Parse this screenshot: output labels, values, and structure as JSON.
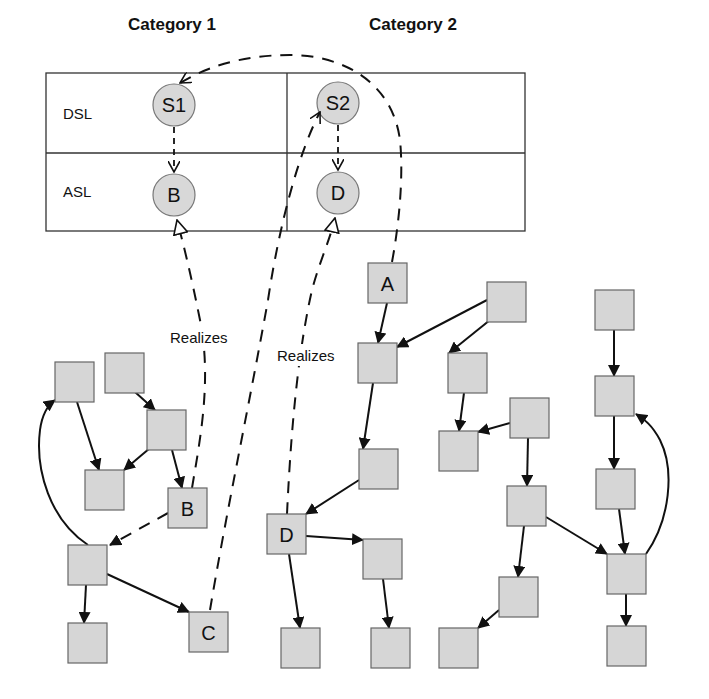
{
  "categories": [
    {
      "label": "Category 1",
      "x": 172,
      "y": 30
    },
    {
      "label": "Category 2",
      "x": 413,
      "y": 30
    }
  ],
  "rows": [
    {
      "label": "DSL",
      "x": 63,
      "y": 119
    },
    {
      "label": "ASL",
      "x": 63,
      "y": 197
    }
  ],
  "table": {
    "x": 46,
    "y": 73,
    "w": 479,
    "h": 158,
    "mid_y": 153,
    "col_x": 287
  },
  "circles": [
    {
      "id": "S1",
      "label": "S1",
      "cx": 174,
      "cy": 105,
      "r": 21
    },
    {
      "id": "B_abs",
      "label": "B",
      "cx": 174,
      "cy": 195,
      "r": 21
    },
    {
      "id": "S2",
      "label": "S2",
      "cx": 338,
      "cy": 103,
      "r": 21
    },
    {
      "id": "D_abs",
      "label": "D",
      "cx": 338,
      "cy": 193,
      "r": 21
    }
  ],
  "realizes_labels": [
    {
      "label": "Realizes",
      "x": 170,
      "y": 343
    },
    {
      "label": "Realizes",
      "x": 277,
      "y": 361
    }
  ],
  "boxes": [
    {
      "id": "L1",
      "label": "",
      "x": 55,
      "y": 362
    },
    {
      "id": "L2",
      "label": "",
      "x": 105,
      "y": 353
    },
    {
      "id": "L3",
      "label": "",
      "x": 147,
      "y": 410
    },
    {
      "id": "L4",
      "label": "",
      "x": 85,
      "y": 470
    },
    {
      "id": "B",
      "label": "B",
      "x": 168,
      "y": 488
    },
    {
      "id": "L5",
      "label": "",
      "x": 68,
      "y": 545
    },
    {
      "id": "L6",
      "label": "",
      "x": 68,
      "y": 623
    },
    {
      "id": "C",
      "label": "C",
      "x": 189,
      "y": 612
    },
    {
      "id": "A",
      "label": "A",
      "x": 368,
      "y": 263
    },
    {
      "id": "M1",
      "label": "",
      "x": 358,
      "y": 343
    },
    {
      "id": "M2",
      "label": "",
      "x": 359,
      "y": 449
    },
    {
      "id": "D",
      "label": "D",
      "x": 267,
      "y": 514
    },
    {
      "id": "M3",
      "label": "",
      "x": 363,
      "y": 539
    },
    {
      "id": "M4",
      "label": "",
      "x": 281,
      "y": 628
    },
    {
      "id": "M5",
      "label": "",
      "x": 371,
      "y": 628
    },
    {
      "id": "R1",
      "label": "",
      "x": 487,
      "y": 282
    },
    {
      "id": "R2",
      "label": "",
      "x": 448,
      "y": 353
    },
    {
      "id": "R3",
      "label": "",
      "x": 439,
      "y": 431
    },
    {
      "id": "R4",
      "label": "",
      "x": 510,
      "y": 398
    },
    {
      "id": "R5",
      "label": "",
      "x": 507,
      "y": 486
    },
    {
      "id": "R6",
      "label": "",
      "x": 499,
      "y": 577
    },
    {
      "id": "R7",
      "label": "",
      "x": 439,
      "y": 628
    },
    {
      "id": "T1",
      "label": "",
      "x": 595,
      "y": 290
    },
    {
      "id": "T2",
      "label": "",
      "x": 595,
      "y": 376
    },
    {
      "id": "T3",
      "label": "",
      "x": 596,
      "y": 469
    },
    {
      "id": "T4",
      "label": "",
      "x": 607,
      "y": 554
    },
    {
      "id": "T5",
      "label": "",
      "x": 607,
      "y": 626
    }
  ],
  "box_size": 39,
  "edges": [
    {
      "from": "L1",
      "to": "L4",
      "x1": 77,
      "y1": 402,
      "x2": 99,
      "y2": 470
    },
    {
      "from": "L2",
      "to": "L3",
      "x1": 135,
      "y1": 392,
      "x2": 155,
      "y2": 410
    },
    {
      "from": "L3",
      "to": "L4",
      "x1": 150,
      "y1": 448,
      "x2": 124,
      "y2": 470
    },
    {
      "from": "L3",
      "to": "B",
      "x1": 172,
      "y1": 450,
      "x2": 182,
      "y2": 488
    },
    {
      "from": "L5",
      "to": "L6",
      "x1": 86,
      "y1": 585,
      "x2": 84,
      "y2": 623
    },
    {
      "from": "L5",
      "to": "C",
      "x1": 107,
      "y1": 574,
      "x2": 189,
      "y2": 612
    },
    {
      "from": "A",
      "to": "M1",
      "x1": 387,
      "y1": 303,
      "x2": 378,
      "y2": 343
    },
    {
      "from": "R1",
      "to": "M1",
      "x1": 487,
      "y1": 300,
      "x2": 397,
      "y2": 347
    },
    {
      "from": "R1",
      "to": "R2",
      "x1": 490,
      "y1": 320,
      "x2": 449,
      "y2": 353
    },
    {
      "from": "M1",
      "to": "M2",
      "x1": 373,
      "y1": 383,
      "x2": 363,
      "y2": 449
    },
    {
      "from": "M2",
      "to": "D",
      "x1": 359,
      "y1": 480,
      "x2": 306,
      "y2": 514
    },
    {
      "from": "D",
      "to": "M3",
      "x1": 306,
      "y1": 536,
      "x2": 363,
      "y2": 540
    },
    {
      "from": "D",
      "to": "M4",
      "x1": 289,
      "y1": 554,
      "x2": 300,
      "y2": 628
    },
    {
      "from": "M3",
      "to": "M5",
      "x1": 383,
      "y1": 579,
      "x2": 389,
      "y2": 628
    },
    {
      "from": "R2",
      "to": "R3",
      "x1": 464,
      "y1": 393,
      "x2": 459,
      "y2": 431
    },
    {
      "from": "R4",
      "to": "R3",
      "x1": 510,
      "y1": 423,
      "x2": 478,
      "y2": 432
    },
    {
      "from": "R4",
      "to": "R5",
      "x1": 528,
      "y1": 438,
      "x2": 527,
      "y2": 486
    },
    {
      "from": "R5",
      "to": "R6",
      "x1": 524,
      "y1": 526,
      "x2": 518,
      "y2": 577
    },
    {
      "from": "R6",
      "to": "R7",
      "x1": 499,
      "y1": 610,
      "x2": 478,
      "y2": 628
    },
    {
      "from": "R5",
      "to": "T4",
      "x1": 546,
      "y1": 517,
      "x2": 607,
      "y2": 554
    },
    {
      "from": "T1",
      "to": "T2",
      "x1": 614,
      "y1": 330,
      "x2": 614,
      "y2": 376
    },
    {
      "from": "T2",
      "to": "T3",
      "x1": 614,
      "y1": 416,
      "x2": 614,
      "y2": 469
    },
    {
      "from": "T3",
      "to": "T4",
      "x1": 619,
      "y1": 509,
      "x2": 625,
      "y2": 554
    },
    {
      "from": "T4",
      "to": "T5",
      "x1": 626,
      "y1": 594,
      "x2": 626,
      "y2": 626
    }
  ]
}
